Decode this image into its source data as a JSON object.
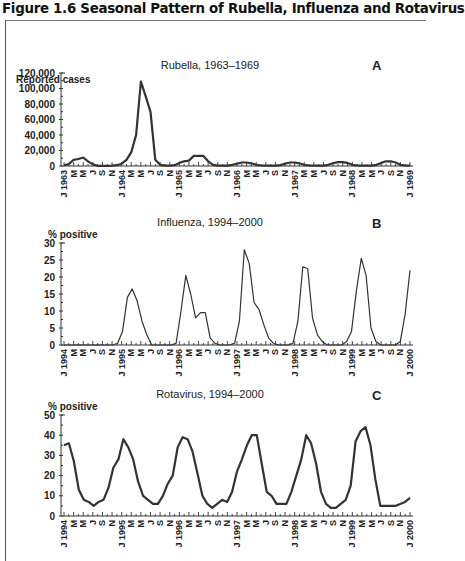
{
  "figure": {
    "title": "Figure 1.6 Seasonal Pattern of Rubella, Influenza and Rotavirus"
  },
  "chart_data": [
    {
      "type": "line",
      "panel": "A",
      "title": "Rubella, 1963–1969",
      "ylabel": "Reported cases",
      "xlabel": "",
      "ylim": [
        0,
        120000
      ],
      "yticks": [
        "0",
        "20,000",
        "40,000",
        "60,000",
        "80,000",
        "100,000",
        "120,000"
      ],
      "ytick_values": [
        0,
        20000,
        40000,
        60000,
        80000,
        100000,
        120000
      ],
      "x_month_labels": [
        "J",
        "M",
        "M",
        "J",
        "S",
        "N"
      ],
      "x_year_labels": [
        "J 1963",
        "J 1964",
        "J 1965",
        "J 1966",
        "J 1967",
        "J 1968",
        "J 1969"
      ],
      "x_start": "1963-01",
      "x_step_months": 2,
      "grid": false,
      "series": [
        {
          "name": "Rubella reported cases",
          "values": [
            1000,
            2500,
            8000,
            9000,
            11000,
            6000,
            2000,
            300,
            200,
            300,
            500,
            1000,
            3000,
            8000,
            18000,
            40000,
            109000,
            90000,
            70000,
            8000,
            1500,
            500,
            500,
            1000,
            4000,
            6000,
            7000,
            13000,
            13000,
            13000,
            6000,
            1500,
            400,
            400,
            400,
            1500,
            3000,
            4500,
            4500,
            3500,
            1500,
            700,
            500,
            500,
            500,
            1200,
            3000,
            4500,
            4500,
            3500,
            1500,
            700,
            500,
            500,
            500,
            1500,
            3500,
            5000,
            5000,
            4000,
            1500,
            600,
            500,
            500,
            500,
            1500,
            4000,
            6000,
            6000,
            4500,
            1500,
            600,
            500
          ]
        }
      ]
    },
    {
      "type": "line",
      "panel": "B",
      "title": "Influenza, 1994–2000",
      "ylabel": "% positive",
      "xlabel": "",
      "ylim": [
        0,
        30
      ],
      "yticks": [
        "0",
        "5",
        "10",
        "15",
        "20",
        "25",
        "30"
      ],
      "ytick_values": [
        0,
        5,
        10,
        15,
        20,
        25,
        30
      ],
      "x_month_labels": [
        "J",
        "M",
        "M",
        "J",
        "S",
        "N"
      ],
      "x_year_labels": [
        "J 1994",
        "J 1995",
        "J 1996",
        "J 1997",
        "J 1998",
        "J 1999",
        "J 2000"
      ],
      "x_start": "1994-01",
      "grid": false,
      "series": [
        {
          "name": "Influenza % positive",
          "values": [
            0,
            0,
            0,
            0,
            0,
            0,
            0,
            0,
            0,
            0,
            0,
            0.5,
            4,
            14,
            16.5,
            13,
            7,
            3,
            0,
            0,
            0,
            0,
            0,
            0.5,
            10,
            20.5,
            15,
            8,
            9.5,
            9.5,
            2,
            0.5,
            0,
            0,
            0,
            0.5,
            7,
            28,
            24,
            12.5,
            10.5,
            6,
            2,
            0.5,
            0,
            0,
            0,
            0.5,
            7,
            23,
            22.5,
            8,
            3,
            1,
            0,
            0,
            0,
            0,
            1,
            4,
            16,
            25.5,
            20.5,
            5,
            1,
            0,
            0,
            0,
            0,
            1,
            9,
            22
          ]
        }
      ]
    },
    {
      "type": "line",
      "panel": "C",
      "title": "Rotavirus, 1994–2000",
      "ylabel": "% positive",
      "xlabel": "",
      "ylim": [
        0,
        50
      ],
      "yticks": [
        "0",
        "10",
        "20",
        "30",
        "40",
        "50"
      ],
      "ytick_values": [
        0,
        10,
        20,
        30,
        40,
        50
      ],
      "x_month_labels": [
        "J",
        "M",
        "M",
        "J",
        "S",
        "N"
      ],
      "x_year_labels": [
        "J 1994",
        "J 1995",
        "J 1996",
        "J 1997",
        "J 1998",
        "J 1999",
        "J 2000"
      ],
      "x_start": "1994-01",
      "grid": false,
      "series": [
        {
          "name": "Rotavirus % positive",
          "values": [
            35,
            36,
            27,
            13,
            8,
            7,
            5,
            7,
            8,
            14,
            24,
            28,
            38,
            34,
            28,
            17,
            10,
            8,
            6,
            6,
            10,
            16,
            20,
            34,
            39,
            38,
            32,
            21,
            10,
            6,
            4,
            6,
            8,
            7,
            12,
            22,
            28,
            35,
            40,
            40,
            26,
            12,
            10,
            6,
            6,
            6,
            12,
            20,
            28,
            40,
            36,
            26,
            12,
            6,
            4,
            4,
            6,
            8,
            15,
            37,
            42,
            44,
            35,
            18,
            5,
            5,
            5,
            5,
            6,
            7,
            9
          ]
        }
      ]
    }
  ]
}
